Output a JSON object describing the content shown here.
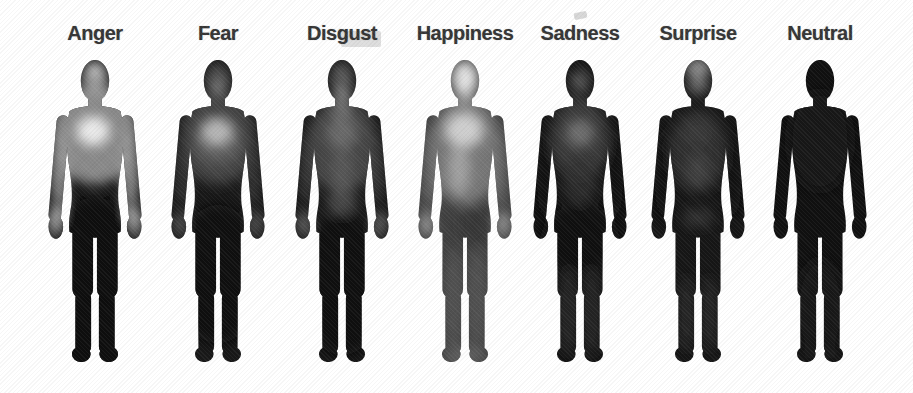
{
  "figure": {
    "background": "#ffffff",
    "label_color": "#353535",
    "colormap": "grayscale: bright = high bodily activation, dark = low activation"
  },
  "chart_data": {
    "type": "heatmap",
    "categories": [
      "Anger",
      "Fear",
      "Disgust",
      "Happiness",
      "Sadness",
      "Surprise",
      "Neutral"
    ],
    "legend_position": "none",
    "title": ""
  },
  "emotions": [
    {
      "label": "Anger",
      "high_activation_regions": "head, upper chest, shoulders, arms, hands",
      "low_activation_regions": "lower torso, legs, feet",
      "heat": {
        "base": "#141414",
        "spots": [
          {
            "x": 50,
            "y": 84,
            "rx": 44,
            "ry": 50,
            "c": "#8f8f8f",
            "o": 0.95
          },
          {
            "x": 48,
            "y": 80,
            "rx": 16,
            "ry": 14,
            "c": "#f0f0f0",
            "o": 0.95
          },
          {
            "x": 50,
            "y": 27,
            "rx": 13,
            "ry": 18,
            "c": "#a0a0a0",
            "o": 0.9
          },
          {
            "x": 50,
            "y": 18,
            "rx": 9,
            "ry": 7,
            "c": "#cfcfcf",
            "o": 0.85
          },
          {
            "x": 14,
            "y": 118,
            "rx": 9,
            "ry": 42,
            "c": "#9a9a9a",
            "o": 0.9
          },
          {
            "x": 86,
            "y": 118,
            "rx": 9,
            "ry": 42,
            "c": "#9a9a9a",
            "o": 0.9
          },
          {
            "x": 11,
            "y": 172,
            "rx": 8,
            "ry": 16,
            "c": "#c8c8c8",
            "o": 0.9
          },
          {
            "x": 89,
            "y": 172,
            "rx": 8,
            "ry": 16,
            "c": "#c8c8c8",
            "o": 0.9
          },
          {
            "x": 50,
            "y": 205,
            "rx": 45,
            "ry": 58,
            "c": "#0a0a0a",
            "o": 0.92
          },
          {
            "x": 50,
            "y": 290,
            "rx": 40,
            "ry": 45,
            "c": "#0a0a0a",
            "o": 0.9
          }
        ]
      }
    },
    {
      "label": "Fear",
      "high_activation_regions": "chest (strong), face, upper torso",
      "low_activation_regions": "legs, feet, lower torso",
      "heat": {
        "base": "#181818",
        "spots": [
          {
            "x": 50,
            "y": 88,
            "rx": 38,
            "ry": 46,
            "c": "#474747",
            "o": 0.95
          },
          {
            "x": 50,
            "y": 92,
            "rx": 24,
            "ry": 20,
            "c": "#6a6a6a",
            "o": 0.7
          },
          {
            "x": 49,
            "y": 81,
            "rx": 15,
            "ry": 13,
            "c": "#bdbdbd",
            "o": 0.95
          },
          {
            "x": 50,
            "y": 29,
            "rx": 12,
            "ry": 17,
            "c": "#565656",
            "o": 0.9
          },
          {
            "x": 50,
            "y": 35,
            "rx": 7,
            "ry": 6,
            "c": "#8a8a8a",
            "o": 0.8
          },
          {
            "x": 15,
            "y": 118,
            "rx": 8,
            "ry": 38,
            "c": "#3a3a3a",
            "o": 0.85
          },
          {
            "x": 85,
            "y": 118,
            "rx": 8,
            "ry": 38,
            "c": "#3a3a3a",
            "o": 0.85
          },
          {
            "x": 11,
            "y": 174,
            "rx": 7,
            "ry": 13,
            "c": "#5a5a5a",
            "o": 0.85
          },
          {
            "x": 89,
            "y": 174,
            "rx": 7,
            "ry": 13,
            "c": "#5a5a5a",
            "o": 0.85
          },
          {
            "x": 50,
            "y": 225,
            "rx": 45,
            "ry": 70,
            "c": "#0c0c0c",
            "o": 0.9
          }
        ]
      }
    },
    {
      "label": "Disgust",
      "high_activation_regions": "mouth and throat, upper chest, stomach midline, hands",
      "low_activation_regions": "legs, feet",
      "heat": {
        "base": "#171717",
        "spots": [
          {
            "x": 50,
            "y": 95,
            "rx": 36,
            "ry": 48,
            "c": "#4a4a4a",
            "o": 0.95
          },
          {
            "x": 50,
            "y": 41,
            "rx": 9,
            "ry": 8,
            "c": "#9a9a9a",
            "o": 0.9
          },
          {
            "x": 50,
            "y": 26,
            "rx": 11,
            "ry": 15,
            "c": "#636363",
            "o": 0.9
          },
          {
            "x": 50,
            "y": 58,
            "rx": 8,
            "ry": 12,
            "c": "#787878",
            "o": 0.85
          },
          {
            "x": 50,
            "y": 82,
            "rx": 15,
            "ry": 16,
            "c": "#6e6e6e",
            "o": 0.85
          },
          {
            "x": 50,
            "y": 120,
            "rx": 10,
            "ry": 24,
            "c": "#5d5d5d",
            "o": 0.75
          },
          {
            "x": 50,
            "y": 152,
            "rx": 15,
            "ry": 13,
            "c": "#575757",
            "o": 0.75
          },
          {
            "x": 15,
            "y": 118,
            "rx": 8,
            "ry": 36,
            "c": "#3d3d3d",
            "o": 0.85
          },
          {
            "x": 85,
            "y": 118,
            "rx": 8,
            "ry": 36,
            "c": "#3d3d3d",
            "o": 0.85
          },
          {
            "x": 11,
            "y": 174,
            "rx": 7,
            "ry": 13,
            "c": "#6f6f6f",
            "o": 0.85
          },
          {
            "x": 89,
            "y": 174,
            "rx": 7,
            "ry": 13,
            "c": "#6f6f6f",
            "o": 0.85
          },
          {
            "x": 50,
            "y": 235,
            "rx": 45,
            "ry": 72,
            "c": "#0c0c0c",
            "o": 0.9
          }
        ]
      }
    },
    {
      "label": "Happiness",
      "high_activation_regions": "whole body, strongest in head/face and chest",
      "low_activation_regions": "none pronounced; legs moderate",
      "heat": {
        "base": "#3f3f3f",
        "spots": [
          {
            "x": 50,
            "y": 100,
            "rx": 37,
            "ry": 55,
            "c": "#868686",
            "o": 0.8
          },
          {
            "x": 50,
            "y": 27,
            "rx": 13,
            "ry": 18,
            "c": "#ececec",
            "o": 0.95
          },
          {
            "x": 50,
            "y": 48,
            "rx": 8,
            "ry": 8,
            "c": "#9e9e9e",
            "o": 0.8
          },
          {
            "x": 49,
            "y": 79,
            "rx": 19,
            "ry": 17,
            "c": "#d8d8d8",
            "o": 0.9
          },
          {
            "x": 44,
            "y": 118,
            "rx": 11,
            "ry": 26,
            "c": "#b2b2b2",
            "o": 0.7
          },
          {
            "x": 60,
            "y": 175,
            "rx": 16,
            "ry": 20,
            "c": "#2e2e2e",
            "o": 0.55
          },
          {
            "x": 15,
            "y": 118,
            "rx": 8,
            "ry": 40,
            "c": "#6f6f6f",
            "o": 0.85
          },
          {
            "x": 85,
            "y": 118,
            "rx": 8,
            "ry": 40,
            "c": "#6f6f6f",
            "o": 0.85
          },
          {
            "x": 11,
            "y": 174,
            "rx": 7,
            "ry": 13,
            "c": "#a8a8a8",
            "o": 0.85
          },
          {
            "x": 89,
            "y": 174,
            "rx": 7,
            "ry": 13,
            "c": "#a8a8a8",
            "o": 0.85
          },
          {
            "x": 38,
            "y": 250,
            "rx": 10,
            "ry": 52,
            "c": "#555555",
            "o": 0.85
          },
          {
            "x": 62,
            "y": 250,
            "rx": 10,
            "ry": 52,
            "c": "#555555",
            "o": 0.85
          },
          {
            "x": 50,
            "y": 308,
            "rx": 22,
            "ry": 10,
            "c": "#6b6b6b",
            "o": 0.7
          }
        ]
      }
    },
    {
      "label": "Sadness",
      "high_activation_regions": "chest (moderate), eyes region",
      "low_activation_regions": "arms, pelvis, legs (strong deactivation)",
      "heat": {
        "base": "#141414",
        "spots": [
          {
            "x": 50,
            "y": 88,
            "rx": 30,
            "ry": 42,
            "c": "#3c3c3c",
            "o": 0.95
          },
          {
            "x": 50,
            "y": 82,
            "rx": 13,
            "ry": 13,
            "c": "#757575",
            "o": 0.9
          },
          {
            "x": 50,
            "y": 30,
            "rx": 10,
            "ry": 13,
            "c": "#4c4c4c",
            "o": 0.9
          },
          {
            "x": 50,
            "y": 29,
            "rx": 8,
            "ry": 4,
            "c": "#676767",
            "o": 0.8
          },
          {
            "x": 50,
            "y": 130,
            "rx": 18,
            "ry": 25,
            "c": "#2e2e2e",
            "o": 0.8
          },
          {
            "x": 14,
            "y": 125,
            "rx": 8,
            "ry": 45,
            "c": "#0c0c0c",
            "o": 0.9
          },
          {
            "x": 86,
            "y": 125,
            "rx": 8,
            "ry": 45,
            "c": "#0c0c0c",
            "o": 0.9
          },
          {
            "x": 50,
            "y": 190,
            "rx": 40,
            "ry": 35,
            "c": "#0e0e0e",
            "o": 0.85
          },
          {
            "x": 38,
            "y": 262,
            "rx": 9,
            "ry": 45,
            "c": "#2d2d2d",
            "o": 0.8
          },
          {
            "x": 62,
            "y": 262,
            "rx": 9,
            "ry": 45,
            "c": "#2d2d2d",
            "o": 0.8
          }
        ]
      }
    },
    {
      "label": "Surprise",
      "high_activation_regions": "upper head and face (strong), chest",
      "low_activation_regions": "arms, lower torso, legs",
      "heat": {
        "base": "#161616",
        "spots": [
          {
            "x": 50,
            "y": 16,
            "rx": 12,
            "ry": 9,
            "c": "#ababab",
            "o": 0.9
          },
          {
            "x": 50,
            "y": 30,
            "rx": 10,
            "ry": 13,
            "c": "#7c7c7c",
            "o": 0.85
          },
          {
            "x": 50,
            "y": 82,
            "rx": 16,
            "ry": 15,
            "c": "#828282",
            "o": 0.85
          },
          {
            "x": 50,
            "y": 100,
            "rx": 30,
            "ry": 42,
            "c": "#303030",
            "o": 0.9
          },
          {
            "x": 50,
            "y": 120,
            "rx": 12,
            "ry": 18,
            "c": "#474747",
            "o": 0.7
          },
          {
            "x": 43,
            "y": 168,
            "rx": 7,
            "ry": 10,
            "c": "#404040",
            "o": 0.7
          },
          {
            "x": 57,
            "y": 168,
            "rx": 7,
            "ry": 10,
            "c": "#404040",
            "o": 0.7
          },
          {
            "x": 14,
            "y": 125,
            "rx": 8,
            "ry": 45,
            "c": "#0d0d0d",
            "o": 0.9
          },
          {
            "x": 86,
            "y": 125,
            "rx": 8,
            "ry": 45,
            "c": "#0d0d0d",
            "o": 0.9
          },
          {
            "x": 38,
            "y": 265,
            "rx": 8,
            "ry": 38,
            "c": "#2a2a2a",
            "o": 0.8
          },
          {
            "x": 62,
            "y": 265,
            "rx": 8,
            "ry": 38,
            "c": "#2a2a2a",
            "o": 0.8
          }
        ]
      }
    },
    {
      "label": "Neutral",
      "high_activation_regions": "none",
      "low_activation_regions": "entire body uniformly dark",
      "heat": {
        "base": "#101010",
        "spots": [
          {
            "x": 50,
            "y": 90,
            "rx": 32,
            "ry": 50,
            "c": "#181818",
            "o": 0.9
          },
          {
            "x": 50,
            "y": 260,
            "rx": 25,
            "ry": 50,
            "c": "#161616",
            "o": 0.8
          },
          {
            "x": 37,
            "y": 306,
            "rx": 8,
            "ry": 6,
            "c": "#242424",
            "o": 0.6
          },
          {
            "x": 63,
            "y": 306,
            "rx": 8,
            "ry": 6,
            "c": "#242424",
            "o": 0.6
          }
        ]
      }
    }
  ]
}
